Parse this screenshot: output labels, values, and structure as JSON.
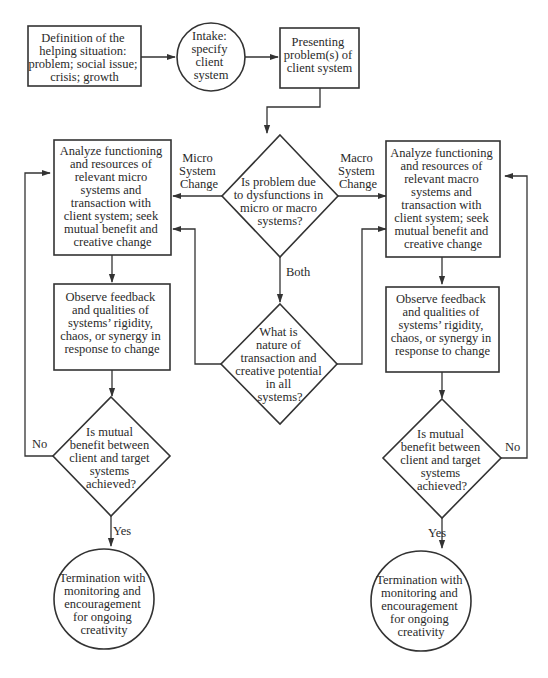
{
  "diagram": {
    "colors": {
      "stroke": "#333333",
      "text": "#2a2a2a",
      "background": "#ffffff"
    },
    "nodes": {
      "definition": {
        "shape": "rect",
        "lines": [
          "Definition of the",
          "helping situation:",
          "problem; social issue;",
          "crisis; growth"
        ]
      },
      "intake": {
        "shape": "circle",
        "lines": [
          "Intake:",
          "specify",
          "client",
          "system"
        ]
      },
      "presenting": {
        "shape": "rect",
        "lines": [
          "Presenting",
          "problem(s) of",
          "client system"
        ]
      },
      "decision_micro_macro": {
        "shape": "diamond",
        "lines": [
          "Is problem due",
          "to dysfunctions in",
          "micro or macro",
          "systems?"
        ]
      },
      "analyze_micro": {
        "shape": "rect",
        "lines": [
          "Analyze functioning",
          "and resources of",
          "relevant micro",
          "systems and",
          "transaction with",
          "client system; seek",
          "mutual benefit and",
          "creative change"
        ]
      },
      "analyze_macro": {
        "shape": "rect",
        "lines": [
          "Analyze functioning",
          "and resources of",
          "relevant macro",
          "systems and",
          "transaction with",
          "client system; seek",
          "mutual benefit and",
          "creative change"
        ]
      },
      "nature_transaction": {
        "shape": "diamond",
        "lines": [
          "What is",
          "nature of",
          "transaction and",
          "creative potential",
          "in all",
          "systems?"
        ]
      },
      "observe_micro": {
        "shape": "rect",
        "lines": [
          "Observe feedback",
          "and qualities of",
          "systems’ rigidity,",
          "chaos, or synergy in",
          "response to change"
        ]
      },
      "observe_macro": {
        "shape": "rect",
        "lines": [
          "Observe feedback",
          "and qualities of",
          "systems’ rigidity,",
          "chaos, or synergy in",
          "response to change"
        ]
      },
      "mutual_micro": {
        "shape": "diamond",
        "lines": [
          "Is mutual",
          "benefit between",
          "client and target",
          "systems",
          "achieved?"
        ]
      },
      "mutual_macro": {
        "shape": "diamond",
        "lines": [
          "Is mutual",
          "benefit between",
          "client and target",
          "systems",
          "achieved?"
        ]
      },
      "termination_micro": {
        "shape": "circle",
        "lines": [
          "Termination with",
          "monitoring and",
          "encouragement",
          "for ongoing",
          "creativity"
        ]
      },
      "termination_macro": {
        "shape": "circle",
        "lines": [
          "Termination with",
          "monitoring and",
          "encouragement",
          "for ongoing",
          "creativity"
        ]
      }
    },
    "edge_labels": {
      "micro_change": [
        "Micro",
        "System",
        "Change"
      ],
      "macro_change": [
        "Macro",
        "System",
        "Change"
      ],
      "both": "Both",
      "no_left": "No",
      "no_right": "No",
      "yes_left": "Yes",
      "yes_right": "Yes"
    }
  }
}
